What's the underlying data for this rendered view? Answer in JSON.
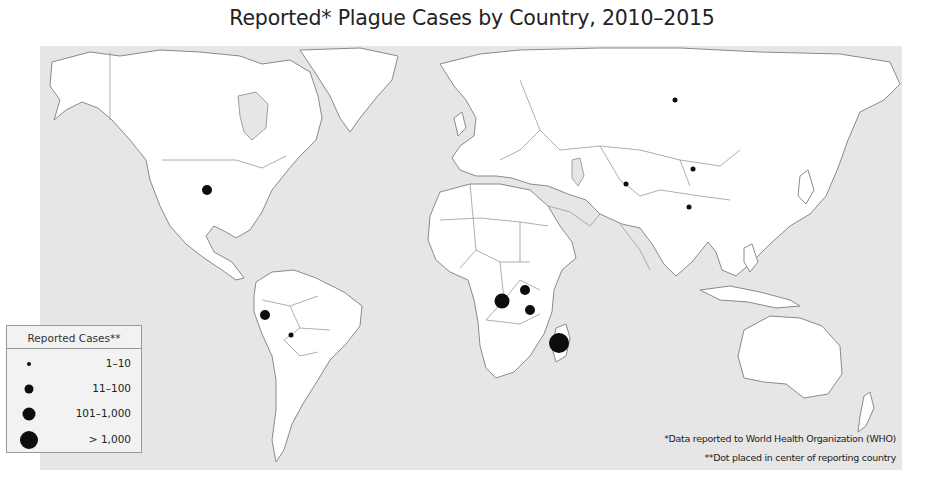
{
  "title": "Reported* Plague Cases by Country, 2010–2015",
  "legend": {
    "title": "Reported Cases**",
    "items": [
      {
        "label": "1–10",
        "size": 4
      },
      {
        "label": "11–100",
        "size": 9
      },
      {
        "label": "101–1,000",
        "size": 13
      },
      {
        "label": "> 1,000",
        "size": 18
      }
    ]
  },
  "notes": [
    "*Data reported to World Health Organization (WHO)",
    "**Dot placed in center of reporting country"
  ],
  "colors": {
    "ocean": "#e6e6e6",
    "land": "#ffffff",
    "dot": "#0d0d0d",
    "border": "#8a8a8a"
  },
  "markers": [
    {
      "country": "United States",
      "category": "11–100",
      "x": 207,
      "y": 190,
      "size": 10
    },
    {
      "country": "Peru",
      "category": "11–100",
      "x": 265,
      "y": 315,
      "size": 10
    },
    {
      "country": "Bolivia",
      "category": "1–10",
      "x": 291,
      "y": 335,
      "size": 5
    },
    {
      "country": "Democratic Republic of the Congo",
      "category": "101–1,000",
      "x": 502,
      "y": 301,
      "size": 15
    },
    {
      "country": "Uganda",
      "category": "11–100",
      "x": 525,
      "y": 290,
      "size": 10
    },
    {
      "country": "Tanzania",
      "category": "11–100",
      "x": 530,
      "y": 310,
      "size": 10
    },
    {
      "country": "Madagascar",
      "category": "> 1,000",
      "x": 559,
      "y": 343,
      "size": 20
    },
    {
      "country": "Russia",
      "category": "1–10",
      "x": 675,
      "y": 100,
      "size": 5
    },
    {
      "country": "Kyrgyzstan",
      "category": "1–10",
      "x": 626,
      "y": 184,
      "size": 5
    },
    {
      "country": "Mongolia",
      "category": "1–10",
      "x": 693,
      "y": 169,
      "size": 5
    },
    {
      "country": "China",
      "category": "1–10",
      "x": 689,
      "y": 207,
      "size": 5
    }
  ]
}
